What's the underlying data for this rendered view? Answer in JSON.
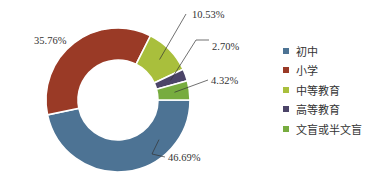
{
  "chart_data": {
    "type": "pie",
    "subtype": "donut",
    "title": "",
    "categories": [
      "初中",
      "小学",
      "中等教育",
      "高等教育",
      "文盲或半文盲"
    ],
    "values": [
      46.69,
      35.76,
      10.53,
      2.7,
      4.32
    ],
    "labels": [
      "46.69%",
      "35.76%",
      "10.53%",
      "2.70%",
      "4.32%"
    ],
    "colors": [
      "#4d7394",
      "#9a3a26",
      "#a9bf3c",
      "#4b4468",
      "#77ac3f"
    ],
    "legend_position": "right",
    "start_angle_deg_clockwise_from_top": 90
  },
  "legend": {
    "items": [
      {
        "label": "初中",
        "color": "#4d7394"
      },
      {
        "label": "小学",
        "color": "#9a3a26"
      },
      {
        "label": "中等教育",
        "color": "#a9bf3c"
      },
      {
        "label": "高等教育",
        "color": "#4b4468"
      },
      {
        "label": "文盲或半文盲",
        "color": "#77ac3f"
      }
    ]
  }
}
